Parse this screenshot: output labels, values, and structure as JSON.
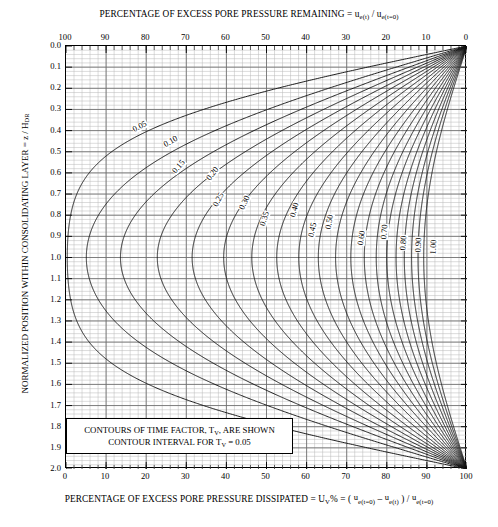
{
  "titles": {
    "top_prefix": "PERCENTAGE OF EXCESS PORE PRESSURE REMAINING = ",
    "bottom_prefix": "PERCENTAGE OF EXCESS PORE PRESSURE DISSIPATED = ",
    "left_axis": "NORMALIZED POSITION WITHIN CONSOLIDATING LAYER  =  z / H",
    "left_axis_sub": "DR"
  },
  "legend": {
    "line1": "CONTOURS OF TIME FACTOR, T",
    "line1_sub": "V",
    "line1_tail": ", ARE SHOWN",
    "line2": "CONTOUR INTERVAL FOR T",
    "line2_sub": "V",
    "line2_tail": " = 0.05"
  },
  "chart_data": {
    "type": "line",
    "xlabel": "PERCENTAGE OF EXCESS PORE PRESSURE DISSIPATED = U_V% = ( u_e(t=0) - u_e(t) ) / u_e(t=0)",
    "ylabel": "NORMALIZED POSITION WITHIN CONSOLIDATING LAYER = z / H_DR",
    "grid": true,
    "legend_position": "inside-bottom-left",
    "x_bottom": {
      "label": "PERCENTAGE OF EXCESS PORE PRESSURE DISSIPATED",
      "lim": [
        0,
        100
      ],
      "ticks": [
        0,
        10,
        20,
        30,
        40,
        50,
        60,
        70,
        80,
        90,
        100
      ],
      "minor_step": 2
    },
    "x_top": {
      "label": "PERCENTAGE OF EXCESS PORE PRESSURE REMAINING",
      "lim": [
        100,
        0
      ],
      "ticks": [
        100,
        90,
        80,
        70,
        60,
        50,
        40,
        30,
        20,
        10,
        0
      ],
      "minor_step": 2
    },
    "y": {
      "lim": [
        0.0,
        2.0
      ],
      "ticks": [
        "0.0",
        "0.1",
        "0.2",
        "0.3",
        "0.4",
        "0.5",
        "0.6",
        "0.7",
        "0.8",
        "0.9",
        "1.0",
        "1.1",
        "1.2",
        "1.3",
        "1.4",
        "1.5",
        "1.6",
        "1.7",
        "1.8",
        "1.9",
        "2.0"
      ],
      "minor_step": 0.02,
      "direction": "down"
    },
    "contour_variable": "T_V",
    "contour_interval": 0.05,
    "contours": [
      0.05,
      0.1,
      0.15,
      0.2,
      0.25,
      0.3,
      0.35,
      0.4,
      0.45,
      0.5,
      0.55,
      0.6,
      0.65,
      0.7,
      0.75,
      0.8,
      0.85,
      0.9,
      0.95,
      1.0
    ],
    "labeled_contours": [
      {
        "value": "0.05",
        "x": 140,
        "y": 127,
        "rot": -27
      },
      {
        "value": "0.10",
        "x": 171,
        "y": 142,
        "rot": -30
      },
      {
        "value": "0.15",
        "x": 179,
        "y": 167,
        "rot": -48
      },
      {
        "value": "0.20",
        "x": 213,
        "y": 174,
        "rot": -52
      },
      {
        "value": "0.25",
        "x": 219,
        "y": 200,
        "rot": -62
      },
      {
        "value": "0.30",
        "x": 245,
        "y": 203,
        "rot": -64
      },
      {
        "value": "0.35",
        "x": 265,
        "y": 219,
        "rot": -72
      },
      {
        "value": "0.40",
        "x": 295,
        "y": 210,
        "rot": -74
      },
      {
        "value": "0.45",
        "x": 313,
        "y": 230,
        "rot": -78
      },
      {
        "value": "0.50",
        "x": 330,
        "y": 222,
        "rot": -80
      },
      {
        "value": "0.60",
        "x": 362,
        "y": 238,
        "rot": -82
      },
      {
        "value": "0.70",
        "x": 385,
        "y": 232,
        "rot": -84
      },
      {
        "value": "0.80",
        "x": 404,
        "y": 243,
        "rot": -86
      },
      {
        "value": "0.90",
        "x": 419,
        "y": 245,
        "rot": -87
      },
      {
        "value": "1.00",
        "x": 434,
        "y": 247,
        "rot": -88
      }
    ]
  }
}
